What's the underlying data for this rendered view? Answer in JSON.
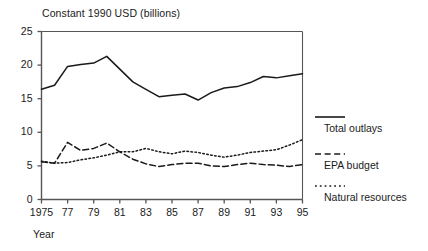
{
  "chart_data": {
    "type": "line",
    "title": "Constant 1990 USD (billions)",
    "xlabel": "Year",
    "ylabel": "",
    "grid": false,
    "legend_position": "right",
    "xlim": [
      1975,
      1995
    ],
    "ylim": [
      0,
      25
    ],
    "ytick_labels": [
      "25",
      "20",
      "15",
      "10",
      "5",
      "0"
    ],
    "ytick_values": [
      25,
      20,
      15,
      10,
      5,
      0
    ],
    "xtick_labels": [
      "1975",
      "77",
      "79",
      "81",
      "83",
      "85",
      "87",
      "89",
      "91",
      "93",
      "95"
    ],
    "xtick_values": [
      1975,
      1977,
      1979,
      1981,
      1983,
      1985,
      1987,
      1989,
      1991,
      1993,
      1995
    ],
    "x": [
      1975,
      1976,
      1977,
      1978,
      1979,
      1980,
      1981,
      1982,
      1983,
      1984,
      1985,
      1986,
      1987,
      1988,
      1989,
      1990,
      1991,
      1992,
      1993,
      1994,
      1995
    ],
    "series": [
      {
        "name": "Total outlays",
        "style": "solid",
        "color": "#1a1a1a",
        "values": [
          16.4,
          17.0,
          19.8,
          20.1,
          20.3,
          21.3,
          19.4,
          17.5,
          16.4,
          15.3,
          15.5,
          15.7,
          14.8,
          15.9,
          16.6,
          16.8,
          17.4,
          18.3,
          18.1,
          18.4,
          18.7
        ]
      },
      {
        "name": "EPA budget",
        "style": "dashed",
        "color": "#1a1a1a",
        "values": [
          5.6,
          5.4,
          8.5,
          7.3,
          7.6,
          8.4,
          7.1,
          6.0,
          5.3,
          4.9,
          5.2,
          5.4,
          5.4,
          5.0,
          4.9,
          5.2,
          5.4,
          5.2,
          5.1,
          4.9,
          5.2
        ]
      },
      {
        "name": "Natural resources",
        "style": "dotted",
        "color": "#1a1a1a",
        "values": [
          5.7,
          5.4,
          5.5,
          5.9,
          6.2,
          6.6,
          7.1,
          7.1,
          7.6,
          7.1,
          6.8,
          7.2,
          7.0,
          6.6,
          6.3,
          6.6,
          7.0,
          7.2,
          7.4,
          8.1,
          8.9
        ]
      }
    ]
  },
  "legend": {
    "items": [
      {
        "label": "Total outlays",
        "style": "solid"
      },
      {
        "label": "EPA budget",
        "style": "dashed"
      },
      {
        "label": "Natural resources",
        "style": "dotted"
      }
    ]
  }
}
